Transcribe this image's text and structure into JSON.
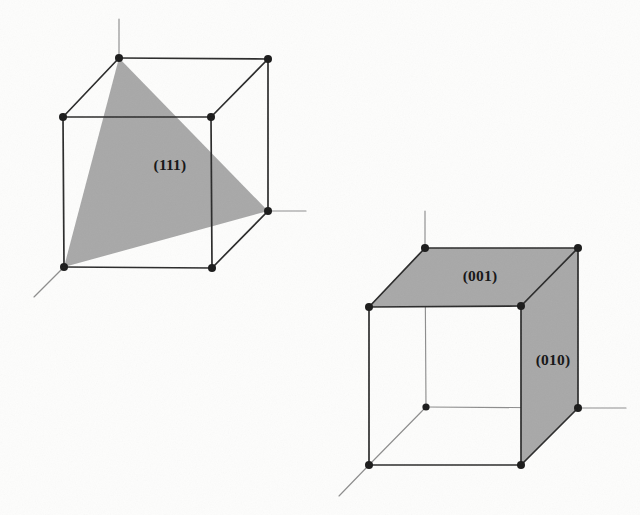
{
  "figure": {
    "background_color": "#fdfdfc",
    "edge_color": "#2a2a2a",
    "hidden_edge_color": "#8d8d8d",
    "axis_color": "#8d8d8d",
    "vertex_color": "#1a1a1a",
    "shade_color": "#a8a8a8",
    "diagrams": [
      {
        "id": "cube-111",
        "name": "cube-diagram-111",
        "labels": [
          {
            "id": "label-111",
            "text": "(111)",
            "x": 170,
            "y": 166
          }
        ],
        "vertices": [
          {
            "id": "back-top-left",
            "x": 119,
            "y": 58,
            "hidden": false
          },
          {
            "id": "back-top-right",
            "x": 268,
            "y": 59,
            "hidden": false
          },
          {
            "id": "front-top-left",
            "x": 63,
            "y": 117,
            "hidden": false
          },
          {
            "id": "front-top-right",
            "x": 211,
            "y": 117,
            "hidden": false
          },
          {
            "id": "back-bottom-right",
            "x": 268,
            "y": 211,
            "hidden": false
          },
          {
            "id": "front-bottom-left",
            "x": 64,
            "y": 267,
            "hidden": false
          },
          {
            "id": "front-bottom-right",
            "x": 212,
            "y": 268,
            "hidden": false
          }
        ],
        "shaded_polygon": [
          {
            "x": 119,
            "y": 58
          },
          {
            "x": 268,
            "y": 211
          },
          {
            "x": 64,
            "y": 267
          }
        ],
        "axes": [
          {
            "id": "axis-vertical",
            "x1": 119,
            "y1": 58,
            "x2": 119,
            "y2": 19
          },
          {
            "id": "axis-right",
            "x1": 268,
            "y1": 211,
            "x2": 306,
            "y2": 211
          },
          {
            "id": "axis-diagonal",
            "x1": 64,
            "y1": 267,
            "x2": 34,
            "y2": 297
          }
        ]
      },
      {
        "id": "cube-001-010",
        "name": "cube-diagram-001-010",
        "labels": [
          {
            "id": "label-001",
            "text": "(001)",
            "x": 480,
            "y": 277
          },
          {
            "id": "label-010",
            "text": "(010)",
            "x": 553,
            "y": 361
          }
        ],
        "vertices": [
          {
            "id": "back-top-left",
            "x": 425,
            "y": 248,
            "hidden": false
          },
          {
            "id": "back-top-right",
            "x": 578,
            "y": 248,
            "hidden": false
          },
          {
            "id": "front-top-left",
            "x": 369,
            "y": 307,
            "hidden": false
          },
          {
            "id": "front-top-right",
            "x": 521,
            "y": 306,
            "hidden": false
          },
          {
            "id": "back-bottom-left",
            "x": 426,
            "y": 407,
            "hidden": true
          },
          {
            "id": "back-bottom-right",
            "x": 578,
            "y": 408,
            "hidden": false
          },
          {
            "id": "front-bottom-left",
            "x": 369,
            "y": 465,
            "hidden": false
          },
          {
            "id": "front-bottom-right",
            "x": 521,
            "y": 465,
            "hidden": false
          }
        ],
        "shaded_polygons": [
          {
            "id": "plane-001",
            "points": [
              {
                "x": 425,
                "y": 248
              },
              {
                "x": 578,
                "y": 248
              },
              {
                "x": 521,
                "y": 306
              },
              {
                "x": 369,
                "y": 307
              }
            ]
          },
          {
            "id": "plane-010",
            "points": [
              {
                "x": 521,
                "y": 306
              },
              {
                "x": 578,
                "y": 248
              },
              {
                "x": 578,
                "y": 408
              },
              {
                "x": 521,
                "y": 465
              }
            ]
          }
        ],
        "axes": [
          {
            "id": "axis-vertical",
            "x1": 425,
            "y1": 248,
            "x2": 425,
            "y2": 211
          },
          {
            "id": "axis-right",
            "x1": 578,
            "y1": 408,
            "x2": 626,
            "y2": 408
          },
          {
            "id": "axis-diagonal",
            "x1": 369,
            "y1": 465,
            "x2": 339,
            "y2": 496
          }
        ]
      }
    ]
  }
}
